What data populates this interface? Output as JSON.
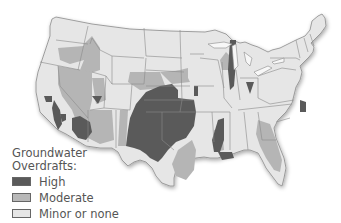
{
  "map": {
    "title": "Groundwater Overdrafts in the Contiguous United States",
    "region": "Contiguous United States",
    "colors": {
      "background": "#ffffff",
      "land_base": "#e4e4e4",
      "borders": "#7a7a7a",
      "high": "#5a5a5a",
      "moderate": "#b5b5b5",
      "minor": "#e8e8e8"
    }
  },
  "legend": {
    "title_line1": "Groundwater",
    "title_line2": "Overdrafts:",
    "items": [
      {
        "label": "High",
        "color": "#5a5a5a"
      },
      {
        "label": "Moderate",
        "color": "#b8b8b8"
      },
      {
        "label": "Minor or none",
        "color": "#e6e6e6"
      }
    ]
  }
}
